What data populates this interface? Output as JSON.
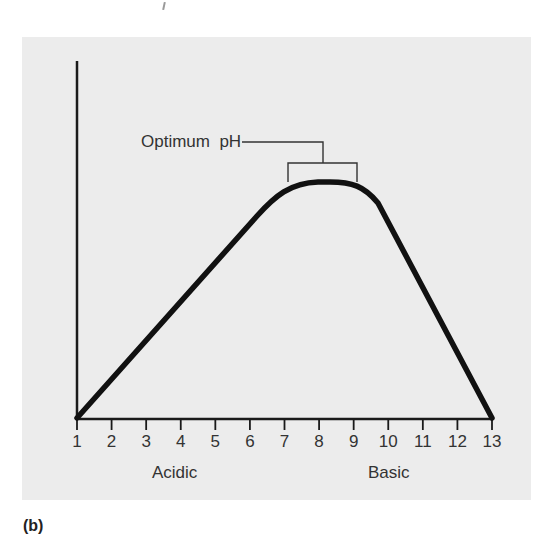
{
  "caption": "(b)",
  "chart_data": {
    "type": "line",
    "title": "",
    "xlabel": "",
    "ylabel": "Enzyme activity",
    "x_ticks": [
      1,
      2,
      3,
      4,
      5,
      6,
      7,
      8,
      9,
      10,
      11,
      12,
      13
    ],
    "x_tick_labels": [
      "1",
      "2",
      "3",
      "4",
      "5",
      "6",
      "7",
      "8",
      "9",
      "10",
      "11",
      "12",
      "13"
    ],
    "xlim": [
      1,
      13
    ],
    "ylim": [
      0,
      100
    ],
    "y_ticks": [],
    "grid": false,
    "legend": null,
    "region_labels": [
      {
        "text": "Acidic",
        "center_x": 4
      },
      {
        "text": "Basic",
        "center_x": 10
      }
    ],
    "annotations": [
      {
        "text": "Optimum  pH",
        "bracket_from": 7.1,
        "bracket_to": 9.0
      }
    ],
    "series": [
      {
        "name": "Enzyme activity",
        "x": [
          1,
          2,
          3,
          4,
          5,
          6,
          6.5,
          7.0,
          7.5,
          8.0,
          8.5,
          9.0,
          9.5,
          10,
          11,
          12,
          13
        ],
        "values": [
          0,
          16,
          32,
          48,
          64,
          79,
          87,
          95,
          99,
          100,
          100,
          98,
          88,
          73,
          49,
          24,
          0
        ]
      }
    ]
  },
  "labels": {
    "y_axis": "Enzyme activity",
    "acidic": "Acidic",
    "basic": "Basic",
    "optimum": "Optimum  pH"
  },
  "colors": {
    "panel_bg": "#ececec",
    "curve": "#111111",
    "axis": "#1a1a1a",
    "text": "#333333"
  }
}
